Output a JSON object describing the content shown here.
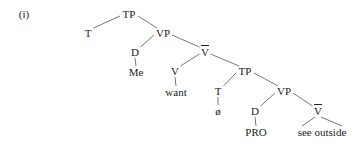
{
  "example_label": "(i)",
  "tree": {
    "nodes": [
      {
        "id": "tp1",
        "label": "TP",
        "x": 129,
        "y": 14
      },
      {
        "id": "t1",
        "label": "T",
        "x": 88,
        "y": 33
      },
      {
        "id": "vp1",
        "label": "VP",
        "x": 163,
        "y": 33
      },
      {
        "id": "d1",
        "label": "D",
        "x": 135,
        "y": 52
      },
      {
        "id": "me",
        "label": "Me",
        "x": 136,
        "y": 72
      },
      {
        "id": "vbar1",
        "label": "V",
        "x": 205,
        "y": 52,
        "bar": true
      },
      {
        "id": "v1",
        "label": "V",
        "x": 175,
        "y": 71
      },
      {
        "id": "want",
        "label": "want",
        "x": 176,
        "y": 92
      },
      {
        "id": "tp2",
        "label": "TP",
        "x": 245,
        "y": 71
      },
      {
        "id": "t2",
        "label": "T",
        "x": 218,
        "y": 91
      },
      {
        "id": "null",
        "label": "ø",
        "x": 218,
        "y": 111
      },
      {
        "id": "vp2",
        "label": "VP",
        "x": 284,
        "y": 91
      },
      {
        "id": "d2",
        "label": "D",
        "x": 255,
        "y": 111
      },
      {
        "id": "pro",
        "label": "PRO",
        "x": 256,
        "y": 132
      },
      {
        "id": "vbar2",
        "label": "V",
        "x": 318,
        "y": 111,
        "bar": true
      },
      {
        "id": "seeout",
        "label": "see outside",
        "x": 322,
        "y": 132
      }
    ],
    "edges": [
      [
        "tp1",
        "t1"
      ],
      [
        "tp1",
        "vp1"
      ],
      [
        "vp1",
        "d1"
      ],
      [
        "d1",
        "me"
      ],
      [
        "vp1",
        "vbar1"
      ],
      [
        "vbar1",
        "v1"
      ],
      [
        "v1",
        "want"
      ],
      [
        "vbar1",
        "tp2"
      ],
      [
        "tp2",
        "t2"
      ],
      [
        "t2",
        "null"
      ],
      [
        "tp2",
        "vp2"
      ],
      [
        "vp2",
        "d2"
      ],
      [
        "d2",
        "pro"
      ],
      [
        "vp2",
        "vbar2"
      ]
    ],
    "triangle": {
      "apex": "vbar2",
      "left_x": 302,
      "right_x": 342,
      "y": 126
    }
  }
}
